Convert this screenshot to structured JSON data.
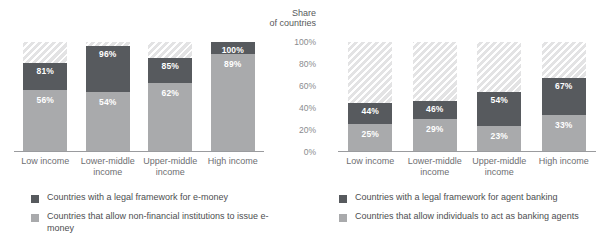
{
  "axis": {
    "title": "Share\nof countries",
    "title_line1": "Share",
    "title_line2": "of countries",
    "ticks": [
      "100%",
      "80%",
      "60%",
      "40%",
      "20%",
      "0%"
    ],
    "tick_values": [
      100,
      80,
      60,
      40,
      20,
      0
    ],
    "range": [
      0,
      100
    ]
  },
  "colors": {
    "dark": "#575a5e",
    "light": "#a9aaac",
    "hatch": "#e3e3e4",
    "baseline": "#9a9b9e",
    "text": "#58595b"
  },
  "left": {
    "legend": [
      {
        "swatch": "dark",
        "label": "Countries with a legal framework for e-money"
      },
      {
        "swatch": "light",
        "label": "Countries that allow non-financial institutions to issue e-money"
      }
    ]
  },
  "right": {
    "legend": [
      {
        "swatch": "dark",
        "label": "Countries with a legal framework for agent banking"
      },
      {
        "swatch": "light",
        "label": "Countries that allow individuals to act as banking agents"
      }
    ]
  },
  "chart_data": [
    {
      "type": "bar",
      "id": "e-money",
      "stacked": true,
      "title": "",
      "xlabel": "",
      "ylabel": "Share of countries",
      "ylim": [
        0,
        100
      ],
      "grid": false,
      "legend_position": "below",
      "categories": [
        "Low income",
        "Lower-middle income",
        "Upper-middle income",
        "High income"
      ],
      "series": [
        {
          "name": "Countries with a legal framework for e-money",
          "values": [
            81,
            96,
            85,
            100
          ]
        },
        {
          "name": "Countries that allow non-financial institutions to issue e-money",
          "values": [
            56,
            54,
            62,
            89
          ]
        }
      ],
      "labels": {
        "upper": [
          "81%",
          "96%",
          "85%",
          "100%"
        ],
        "lower": [
          "56%",
          "54%",
          "62%",
          "89%"
        ]
      }
    },
    {
      "type": "bar",
      "id": "agent-banking",
      "stacked": true,
      "title": "",
      "xlabel": "",
      "ylabel": "Share of countries",
      "ylim": [
        0,
        100
      ],
      "grid": false,
      "legend_position": "below",
      "categories": [
        "Low income",
        "Lower-middle income",
        "Upper-middle income",
        "High income"
      ],
      "series": [
        {
          "name": "Countries with a legal framework for agent banking",
          "values": [
            44,
            46,
            54,
            67
          ]
        },
        {
          "name": "Countries that allow individuals to act as banking agents",
          "values": [
            25,
            29,
            23,
            33
          ]
        }
      ],
      "labels": {
        "upper": [
          "44%",
          "46%",
          "54%",
          "67%"
        ],
        "lower": [
          "25%",
          "29%",
          "23%",
          "33%"
        ]
      }
    }
  ]
}
